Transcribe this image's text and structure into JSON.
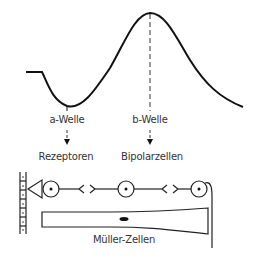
{
  "waves": {
    "a_wave": "a-Welle",
    "b_wave": "b-Welle"
  },
  "cells": {
    "receptors": "Rezeptoren",
    "bipolar": "Bipolarzellen",
    "mueller": "Müller-Zellen"
  },
  "colors": {
    "line": "#111111",
    "text": "#333333"
  }
}
